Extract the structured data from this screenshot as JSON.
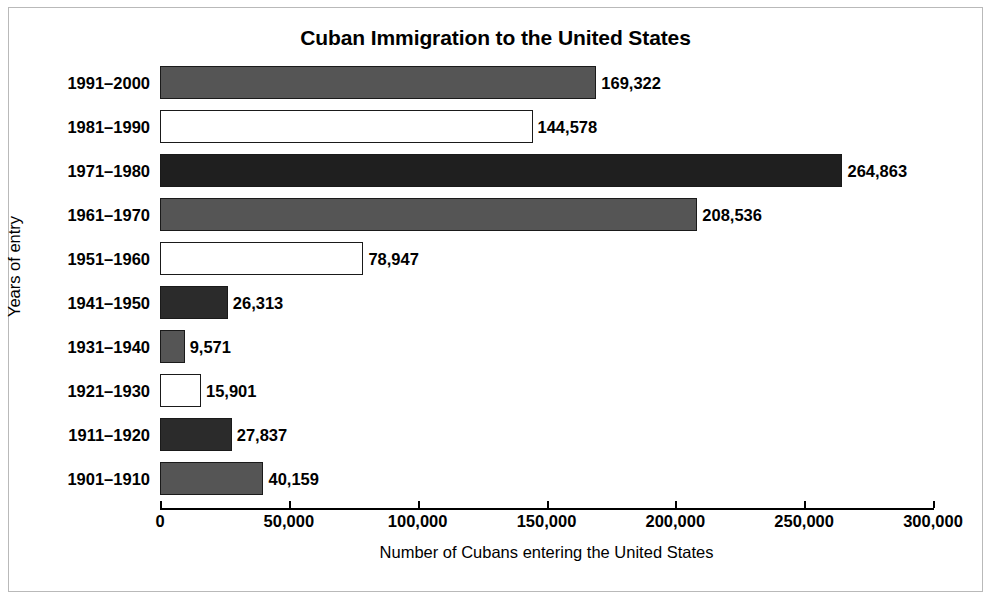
{
  "chart_data": {
    "type": "bar",
    "orientation": "horizontal",
    "title": "Cuban Immigration to the United States",
    "xlabel": "Number of Cubans entering the United States",
    "ylabel": "Years of entry",
    "xlim": [
      0,
      300000
    ],
    "grid": false,
    "legend": "none",
    "xticks": [
      "0",
      "50,000",
      "100,000",
      "150,000",
      "200,000",
      "250,000",
      "300,000"
    ],
    "xtick_values": [
      0,
      50000,
      100000,
      150000,
      200000,
      250000,
      300000
    ],
    "categories": [
      "1991–2000",
      "1981–1990",
      "1971–1980",
      "1961–1970",
      "1951–1960",
      "1941–1950",
      "1931–1940",
      "1921–1930",
      "1911–1920",
      "1901–1910"
    ],
    "values": [
      169322,
      144578,
      264863,
      208536,
      78947,
      26313,
      9571,
      15901,
      27837,
      40159
    ],
    "value_labels": [
      "169,322",
      "144,578",
      "264,863",
      "208,536",
      "78,947",
      "26,313",
      "9,571",
      "15,901",
      "27,837",
      "40,159"
    ],
    "bar_fills": [
      "#555555",
      "#ffffff",
      "#1f1f1f",
      "#555555",
      "#ffffff",
      "#2b2b2b",
      "#555555",
      "#ffffff",
      "#2b2b2b",
      "#555555"
    ],
    "bar_edge_color": "#1a1a1a",
    "axis_color": "#000000",
    "frame_color": "#b9b9b9",
    "background": "#ffffff"
  }
}
